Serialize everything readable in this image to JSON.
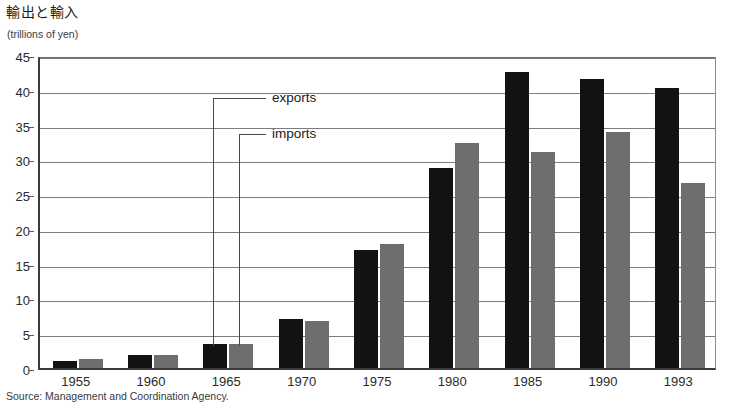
{
  "chart_data": {
    "type": "bar",
    "title": "輸出と輸入",
    "subtitle": "(trillions of yen)",
    "xlabel": "",
    "ylabel": "(trillions of yen)",
    "ylim": [
      0,
      45
    ],
    "ytick_step": 5,
    "yticks": [
      0,
      5,
      10,
      15,
      20,
      25,
      30,
      35,
      40,
      45
    ],
    "grid": true,
    "legend": "annotations",
    "legend_position": "inline-callout",
    "categories": [
      "1955",
      "1960",
      "1965",
      "1970",
      "1975",
      "1980",
      "1985",
      "1990",
      "1993"
    ],
    "series": [
      {
        "name": "exports",
        "color": "#121212",
        "values": [
          1.0,
          1.8,
          3.5,
          7.0,
          16.9,
          28.8,
          42.5,
          41.5,
          40.3
        ]
      },
      {
        "name": "imports",
        "color": "#6e6e6e",
        "values": [
          1.3,
          1.8,
          3.4,
          6.8,
          17.9,
          32.3,
          31.1,
          33.9,
          26.6
        ]
      }
    ],
    "annotations": [
      {
        "label": "exports",
        "points_to_series": "exports",
        "points_to_category": "1965"
      },
      {
        "label": "imports",
        "points_to_series": "imports",
        "points_to_category": "1965"
      }
    ]
  },
  "header": {
    "title": "輸出と輸入",
    "unit_label": "(trillions of yen)"
  },
  "axes": {
    "y_ticks": [
      "45",
      "40",
      "35",
      "30",
      "25",
      "20",
      "15",
      "10",
      "5",
      "0"
    ],
    "x_ticks": [
      "1955",
      "1960",
      "1965",
      "1970",
      "1975",
      "1980",
      "1985",
      "1990",
      "1993"
    ]
  },
  "annotations": {
    "exports_label": "exports",
    "imports_label": "imports"
  },
  "footer": {
    "source": "Source: Management and Coordination Agency."
  },
  "colors": {
    "exports_bar": "#121212",
    "imports_bar": "#6e6e6e",
    "gridline": "#7d7d7d",
    "axis": "#3b3b3b",
    "background": "#ffffff"
  }
}
